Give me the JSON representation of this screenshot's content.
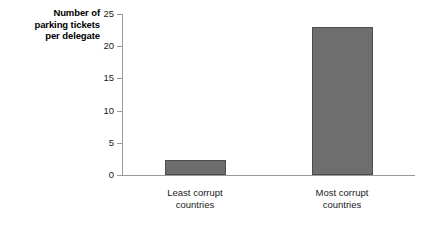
{
  "chart_data": {
    "type": "bar",
    "title": "",
    "subtitle": "",
    "xlabel": "",
    "ylabel": "Number of parking tickets per delegate",
    "ylabel_lines": [
      "Number of",
      "parking tickets",
      "per delegate"
    ],
    "categories": [
      "Least corrupt countries",
      "Most corrupt countries"
    ],
    "category_lines": [
      [
        "Least corrupt",
        "countries"
      ],
      [
        "Most corrupt",
        "countries"
      ]
    ],
    "values": [
      2.3,
      23
    ],
    "ylim": [
      0,
      25
    ],
    "ytick_values": [
      0,
      5,
      10,
      15,
      20,
      25
    ],
    "ytick_labels": [
      "0",
      "5",
      "10",
      "15",
      "20",
      "25"
    ],
    "grid": false,
    "legend": false,
    "legend_position": "none",
    "bar_color": "#6e6e6e",
    "bar_edge_color": "#4c4c4c",
    "axis_color": "#9a9a9a",
    "background_color": "#ffffff"
  }
}
